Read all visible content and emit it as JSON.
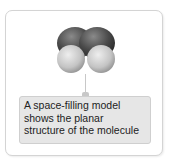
{
  "diagram": {
    "figure": {
      "type": "space-filling model",
      "atoms": [
        {
          "element": "C",
          "color": "#4a4a4a",
          "position": "top-left"
        },
        {
          "element": "C",
          "color": "#4a4a4a",
          "position": "top-right"
        },
        {
          "element": "H",
          "color": "#c4c4c4",
          "position": "bottom-left"
        },
        {
          "element": "H",
          "color": "#c4c4c4",
          "position": "bottom-right"
        }
      ]
    },
    "callout": {
      "text": "A space-filling model shows the planar structure of the molecule"
    },
    "colors": {
      "callout_bg": "#e6e6e6",
      "border": "#d4d4d4",
      "leader_line": "#c8c8c8"
    }
  }
}
